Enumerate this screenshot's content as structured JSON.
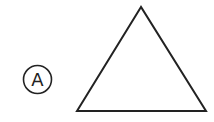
{
  "figure": {
    "label": "A",
    "label_circle": {
      "cx": 37.5,
      "cy": 79.5,
      "r": 14
    },
    "shape": "triangle",
    "triangle_points": "141,7 77,111 206,111",
    "stroke_color": "#222222",
    "background": "#ffffff"
  }
}
